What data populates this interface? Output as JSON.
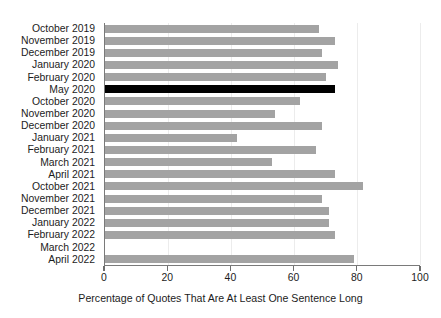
{
  "chart_data": {
    "type": "bar",
    "orientation": "horizontal",
    "title": "",
    "xlabel": "Percentage of Quotes That Are At Least One Sentence Long",
    "ylabel": "",
    "xlim": [
      0,
      100
    ],
    "xticks": [
      0,
      20,
      40,
      60,
      80,
      100
    ],
    "grid": true,
    "grid_axis": "x",
    "legend": "none",
    "categories": [
      "October 2019",
      "November 2019",
      "December 2019",
      "January 2020",
      "February 2020",
      "May 2020",
      "October 2020",
      "November 2020",
      "December 2020",
      "January 2021",
      "February 2021",
      "March 2021",
      "April 2021",
      "October 2021",
      "November 2021",
      "December 2021",
      "January 2022",
      "February 2022",
      "March 2022",
      "April 2022"
    ],
    "values": [
      68,
      73,
      69,
      74,
      70,
      73,
      62,
      54,
      69,
      42,
      67,
      53,
      73,
      82,
      69,
      71,
      71,
      73,
      0,
      79
    ],
    "highlight_category": "May 2020",
    "highlight_index": 5,
    "colors": {
      "bar": "#a3a3a3",
      "highlight_bar": "#000000",
      "axis": "#7a7a7a",
      "grid": "#ececec",
      "text": "#1c1c1c",
      "background": "#ffffff"
    }
  }
}
